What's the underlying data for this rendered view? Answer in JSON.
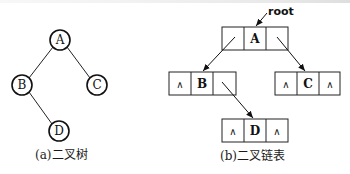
{
  "tree": {
    "caption": "(a)二叉树",
    "nodes": [
      {
        "id": "A",
        "label": "A",
        "cx": 60,
        "cy": 40
      },
      {
        "id": "B",
        "label": "B",
        "cx": 22,
        "cy": 85
      },
      {
        "id": "C",
        "label": "C",
        "cx": 97,
        "cy": 85
      },
      {
        "id": "D",
        "label": "D",
        "cx": 59,
        "cy": 131
      }
    ],
    "edges": [
      [
        "A",
        "B"
      ],
      [
        "A",
        "C"
      ],
      [
        "B",
        "D"
      ]
    ]
  },
  "linked": {
    "caption": "(b)二叉链表",
    "root_label": "root",
    "null_symbol": "∧",
    "nodes": [
      {
        "id": "A",
        "label": "A",
        "x": 222,
        "y": 27,
        "lchild": "B",
        "rchild": "C"
      },
      {
        "id": "B",
        "label": "B",
        "x": 169,
        "y": 72,
        "lchild": null,
        "rchild": "D"
      },
      {
        "id": "C",
        "label": "C",
        "x": 275,
        "y": 72,
        "lchild": null,
        "rchild": null
      },
      {
        "id": "D",
        "label": "D",
        "x": 222,
        "y": 119,
        "lchild": null,
        "rchild": null
      }
    ]
  }
}
